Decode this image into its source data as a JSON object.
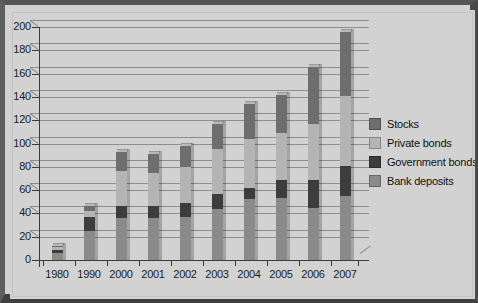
{
  "chart_data": {
    "type": "bar",
    "subtype": "stacked-bar-3d",
    "title": "",
    "xlabel": "",
    "ylabel": "",
    "ylim": [
      0,
      200
    ],
    "ytick_step": 20,
    "yticks": [
      0,
      20,
      40,
      60,
      80,
      100,
      120,
      140,
      160,
      180,
      200
    ],
    "grid": true,
    "grid_axis": "y",
    "legend_position": "right",
    "categories": [
      "1980",
      "1990",
      "2000",
      "2001",
      "2002",
      "2003",
      "2004",
      "2005",
      "2006",
      "2007"
    ],
    "series": [
      {
        "name": "Bank deposits",
        "color": "#8a8a8a",
        "values": [
          6,
          25,
          36,
          36,
          37,
          44,
          52,
          53,
          45,
          55
        ]
      },
      {
        "name": "Government bonds",
        "color": "#3d3d3d",
        "values": [
          3,
          12,
          10,
          10,
          12,
          13,
          10,
          16,
          24,
          26
        ]
      },
      {
        "name": "Private bonds",
        "color": "#b4b4b4",
        "values": [
          2,
          5,
          30,
          29,
          31,
          38,
          42,
          40,
          48,
          60
        ]
      },
      {
        "name": "Stocks",
        "color": "#6e6e6e",
        "values": [
          1,
          4,
          17,
          16,
          18,
          22,
          30,
          33,
          49,
          55
        ]
      }
    ],
    "totals": [
      12,
      46,
      93,
      91,
      98,
      117,
      134,
      142,
      166,
      196
    ]
  },
  "legend": {
    "items": [
      {
        "label": "Stocks",
        "color": "#6e6e6e"
      },
      {
        "label": "Private bonds",
        "color": "#b4b4b4"
      },
      {
        "label": "Government bonds",
        "color": "#3d3d3d"
      },
      {
        "label": "Bank deposits",
        "color": "#8a8a8a"
      }
    ]
  },
  "colors": {
    "frame": "#4a4a4a",
    "background": "#d2d2d2",
    "axis": "#3a3a3a",
    "gridline": "#8e8e8e",
    "text": "#1c1c1c"
  }
}
